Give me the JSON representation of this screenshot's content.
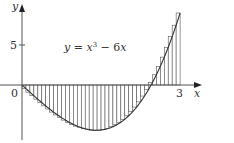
{
  "figure": {
    "equation_label": "y = x³ − 6x",
    "equation_parts": {
      "lhs": "y",
      "eq": " = ",
      "x1": "x",
      "exp": "3",
      "rest": " − 6",
      "x2": "x"
    },
    "axis_x_label": "x",
    "axis_y_label": "y",
    "tick_x_0": "0",
    "tick_x_3": "3",
    "tick_y_5": "5"
  },
  "chart_data": {
    "type": "area",
    "function": "x^3 - 6x",
    "interval": [
      0,
      3
    ],
    "n_rectangles": 40,
    "rule": "right endpoint",
    "xlim": [
      0,
      3.2
    ],
    "ylim": [
      -6,
      10
    ],
    "x_ticks": [
      0,
      3
    ],
    "y_ticks": [
      5
    ],
    "xlabel": "x",
    "ylabel": "y",
    "annotation": "y = x³ − 6x",
    "grid": false,
    "colors": {
      "axis": "#555555",
      "curve": "#333333",
      "rect_stroke": "#555555",
      "rect_fill": "#ffffff"
    }
  }
}
